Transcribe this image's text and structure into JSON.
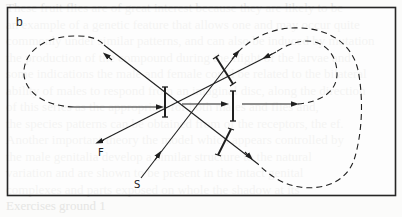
{
  "figure": {
    "panel_label": "b",
    "labels": {
      "f": "F",
      "s": "S"
    },
    "colors": {
      "line": "#1f1f1f",
      "frame": "#262626",
      "background": "#fbfbfa",
      "bleed_text": "#e6e6e4"
    },
    "elements": {
      "mirrors": [
        {
          "name": "mirror-1",
          "orientation": "vertical",
          "x": 165,
          "y1": 87,
          "y2": 117
        },
        {
          "name": "mirror-2",
          "orientation": "vertical",
          "x": 233,
          "y1": 91,
          "y2": 121
        },
        {
          "name": "mirror-3",
          "orientation": "tilted",
          "from": [
            216,
            57
          ],
          "to": [
            233,
            84
          ]
        },
        {
          "name": "mirror-4",
          "orientation": "tilted",
          "from": [
            218,
            155
          ],
          "to": [
            231,
            129
          ]
        }
      ],
      "beams": [
        {
          "name": "beam-f",
          "label": "F",
          "direction": "down-left"
        },
        {
          "name": "beam-s",
          "label": "S",
          "direction": "up-right"
        }
      ],
      "loops": [
        {
          "name": "left-loop",
          "style": "dashed"
        },
        {
          "name": "right-outer-loop",
          "style": "dashed"
        },
        {
          "name": "right-inner-loop",
          "style": "dashed"
        }
      ]
    }
  },
  "background_bleed_lines": [
    "These fruit flies are of great interest because they are likely to be",
    "an example of a genetic feature that allows one and may occur quite",
    "commonly under similar patterns, and can also be induced by mutation",
    "the production of the compound during the flight of the larvae and",
    "some indications the male and female could be related to the bilateral",
    "ability of males to respond from an imaginal disc, along the direction",
    "of this series as the appropriate for both males and flies and,",
    "the species patterns can be obtained from of the receptors, the ef.",
    "Another important theory the model which appears controlled by",
    "the male genitalia develop a similar structure to the natural",
    "variation and are shown to be present in the intact genital",
    "complexes and parts exposed on whole the shadow at its",
    "Exercises ground 1",
    "The consumption of the vest Proof of the two was"
  ]
}
